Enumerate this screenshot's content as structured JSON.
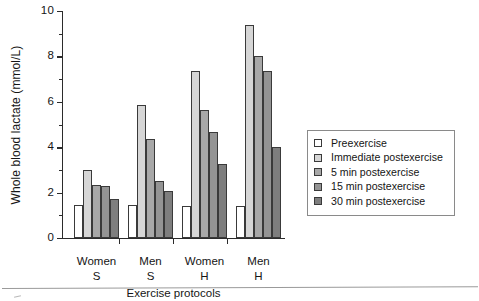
{
  "chart_data": {
    "type": "bar",
    "title": "",
    "xlabel": "Exercise protocols",
    "ylabel": "Whole blood lactate (mmol/L)",
    "ylim": [
      0,
      10
    ],
    "yticks": [
      0,
      2,
      4,
      6,
      8,
      10
    ],
    "yminor_step": 1,
    "grid": false,
    "legend_position": "right",
    "categories": [
      "Women S",
      "Men S",
      "Women H",
      "Men H"
    ],
    "category_lines": [
      {
        "line1": "Women",
        "line2": "S"
      },
      {
        "line1": "Men",
        "line2": "S"
      },
      {
        "line1": "Women",
        "line2": "H"
      },
      {
        "line1": "Men",
        "line2": "H"
      }
    ],
    "series": [
      {
        "name": "Preexercise",
        "color": "#ffffff",
        "values": [
          1.45,
          1.45,
          1.4,
          1.4
        ]
      },
      {
        "name": "Immediate postexercise",
        "color": "#d6d6d6",
        "values": [
          2.98,
          5.85,
          7.35,
          9.4
        ]
      },
      {
        "name": "5 min postexercise",
        "color": "#a8a8a8",
        "values": [
          2.35,
          4.35,
          5.65,
          8.0
        ]
      },
      {
        "name": "15 min postexercise",
        "color": "#949494",
        "values": [
          2.28,
          2.5,
          4.68,
          7.35
        ]
      },
      {
        "name": "30 min postexercise",
        "color": "#7e7e7e",
        "values": [
          1.74,
          2.08,
          3.26,
          4.03
        ]
      }
    ]
  },
  "legend": {
    "items": [
      {
        "label": "Preexercise"
      },
      {
        "label": "Immediate postexercise"
      },
      {
        "label": "5 min postexercise"
      },
      {
        "label": "15 min postexercise"
      },
      {
        "label": "30 min postexercise"
      }
    ]
  },
  "axes": {
    "y_title": "Whole blood lactate (mmol/L)",
    "x_title": "Exercise protocols",
    "y_tick_labels": [
      "0",
      "2",
      "4",
      "6",
      "8",
      "10"
    ]
  },
  "colors": {
    "axis": "#2b2b2b",
    "bar_outline": "#3a3a3a",
    "legend_border": "#8a8a8a",
    "page_background": "#ffffff"
  }
}
